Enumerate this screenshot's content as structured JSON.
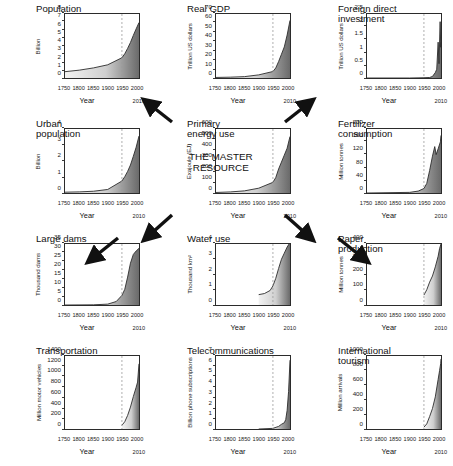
{
  "figure": {
    "xlabel": "Year",
    "x_ticks": [
      "1750",
      "1800",
      "1850",
      "1900",
      "1950",
      "2000"
    ],
    "x_end_label": "2010",
    "marker_year": "1950",
    "center_subtitle": "THE MASTER\nRESOURCE",
    "accent": "#555555",
    "fill_dark": "#6a6a6a",
    "fill_light": "#f2f2f2",
    "line_color": "#2b2b2b"
  },
  "chart_data": [
    {
      "id": "population",
      "type": "area",
      "title": "Population",
      "ylabel": "Billion",
      "xlabel": "Year",
      "ylim": [
        0,
        8
      ],
      "y_ticks": [
        0,
        1,
        2,
        3,
        4,
        5,
        6,
        7,
        8
      ],
      "xlim": [
        1750,
        2010
      ],
      "x": [
        1750,
        1800,
        1850,
        1900,
        1950,
        1960,
        1970,
        1980,
        1990,
        2000,
        2010
      ],
      "values": [
        0.79,
        0.98,
        1.26,
        1.65,
        2.53,
        3.03,
        3.7,
        4.44,
        5.32,
        6.14,
        6.93
      ]
    },
    {
      "id": "real-gdp",
      "type": "area",
      "title": "Real GDP",
      "ylabel": "Trillion US dollars",
      "xlabel": "Year",
      "ylim": [
        0,
        70
      ],
      "y_ticks": [
        0,
        10,
        20,
        30,
        40,
        50,
        60,
        70
      ],
      "xlim": [
        1750,
        2010
      ],
      "x": [
        1750,
        1800,
        1850,
        1900,
        1950,
        1960,
        1970,
        1980,
        1990,
        2000,
        2010
      ],
      "values": [
        0.6,
        0.9,
        1.5,
        3.4,
        7.1,
        11.0,
        18.0,
        26.0,
        34.0,
        47.0,
        63.0
      ]
    },
    {
      "id": "foreign-direct-investment",
      "type": "area",
      "title": "Foreign direct\ninvestment",
      "ylabel": "Trillion US dollars",
      "xlabel": "Year",
      "ylim": [
        0,
        2.5
      ],
      "y_ticks": [
        0,
        0.5,
        1,
        1.5,
        2,
        2.5
      ],
      "xlim": [
        1750,
        2010
      ],
      "x": [
        1750,
        1900,
        1950,
        1970,
        1980,
        1990,
        1995,
        2000,
        2003,
        2007,
        2009,
        2010
      ],
      "values": [
        0,
        0.0,
        0.01,
        0.02,
        0.06,
        0.21,
        0.34,
        1.4,
        0.56,
        2.2,
        1.2,
        1.4
      ]
    },
    {
      "id": "urban-population",
      "type": "area",
      "title": "Urban\npopulation",
      "ylabel": "Billion",
      "xlabel": "Year",
      "ylim": [
        0,
        4
      ],
      "y_ticks": [
        0,
        1,
        2,
        3,
        4
      ],
      "xlim": [
        1750,
        2010
      ],
      "x": [
        1750,
        1800,
        1850,
        1900,
        1950,
        1960,
        1970,
        1980,
        1990,
        2000,
        2010
      ],
      "values": [
        0.05,
        0.07,
        0.11,
        0.22,
        0.75,
        1.02,
        1.35,
        1.75,
        2.29,
        2.86,
        3.56
      ]
    },
    {
      "id": "primary-energy-use",
      "type": "area",
      "title": "Primary\nenergy use",
      "subtitle": "THE MASTER\nRESOURCE",
      "ylabel": "Exajoule (EJ)",
      "xlabel": "Year",
      "ylim": [
        0,
        600
      ],
      "y_ticks": [
        0,
        100,
        200,
        300,
        400,
        500,
        600
      ],
      "xlim": [
        1750,
        2010
      ],
      "x": [
        1750,
        1800,
        1850,
        1900,
        1950,
        1960,
        1970,
        1980,
        1990,
        2000,
        2010
      ],
      "values": [
        5,
        10,
        20,
        45,
        100,
        145,
        225,
        290,
        355,
        420,
        530
      ]
    },
    {
      "id": "fertilizer-consumption",
      "type": "area",
      "title": "Fertilizer\nconsumption",
      "ylabel": "Million tonnes",
      "xlabel": "Year",
      "ylim": [
        0,
        200
      ],
      "y_ticks": [
        0,
        40,
        80,
        120,
        160,
        200
      ],
      "xlim": [
        1750,
        2010
      ],
      "x": [
        1750,
        1900,
        1930,
        1950,
        1960,
        1970,
        1980,
        1988,
        1993,
        2000,
        2008,
        2010
      ],
      "values": [
        0,
        2,
        6,
        14,
        30,
        70,
        115,
        145,
        120,
        138,
        160,
        180
      ]
    },
    {
      "id": "large-dams",
      "type": "area",
      "title": "Large dams",
      "ylabel": "Thousand dams",
      "xlabel": "Year",
      "ylim": [
        0,
        35
      ],
      "y_ticks": [
        0,
        5,
        10,
        15,
        20,
        25,
        30,
        35
      ],
      "xlim": [
        1750,
        2010
      ],
      "x": [
        1750,
        1850,
        1900,
        1930,
        1950,
        1960,
        1970,
        1980,
        1990,
        2000,
        2010
      ],
      "values": [
        0,
        0.1,
        0.5,
        2.0,
        5.5,
        9.0,
        16.0,
        24.0,
        29.0,
        31.0,
        32.5
      ]
    },
    {
      "id": "water-use",
      "type": "area",
      "title": "Water use",
      "ylabel": "Thousand km²",
      "xlabel": "Year",
      "ylim": [
        0,
        4
      ],
      "y_ticks": [
        0,
        1,
        2,
        3,
        4
      ],
      "xlim": [
        1750,
        2010
      ],
      "x": [
        1900,
        1920,
        1940,
        1950,
        1960,
        1970,
        1980,
        1990,
        2000,
        2010
      ],
      "values": [
        0.68,
        0.75,
        0.95,
        1.25,
        1.75,
        2.4,
        3.0,
        3.4,
        3.8,
        4.1
      ]
    },
    {
      "id": "paper-production",
      "type": "area",
      "title": "Paper\nproduction",
      "ylabel": "Million tonnes",
      "xlabel": "Year",
      "ylim": [
        0,
        400
      ],
      "y_ticks": [
        0,
        100,
        200,
        300,
        400
      ],
      "xlim": [
        1750,
        2010
      ],
      "x": [
        1950,
        1960,
        1970,
        1980,
        1990,
        2000,
        2005,
        2010
      ],
      "values": [
        65,
        100,
        150,
        190,
        250,
        320,
        370,
        400
      ]
    },
    {
      "id": "transportation",
      "type": "area",
      "title": "Transportation",
      "ylabel": "Million motor vehicles",
      "xlabel": "Year",
      "ylim": [
        0,
        1400
      ],
      "y_ticks": [
        0,
        200,
        400,
        600,
        800,
        1000,
        1200,
        1400
      ],
      "xlim": [
        1750,
        2010
      ],
      "x": [
        1950,
        1960,
        1970,
        1980,
        1990,
        2000,
        2005,
        2010
      ],
      "values": [
        70,
        140,
        260,
        420,
        620,
        800,
        900,
        1250
      ]
    },
    {
      "id": "telecommunications",
      "type": "area",
      "title": "Telecommunications",
      "ylabel": "Billion phone subscriptions",
      "xlabel": "Year",
      "ylim": [
        0,
        7
      ],
      "y_ticks": [
        0,
        1,
        2,
        3,
        4,
        5,
        6,
        7
      ],
      "xlim": [
        1750,
        2010
      ],
      "x": [
        1900,
        1950,
        1970,
        1980,
        1990,
        1995,
        2000,
        2005,
        2010
      ],
      "values": [
        0,
        0.06,
        0.25,
        0.45,
        0.6,
        0.9,
        1.8,
        3.6,
        6.6
      ]
    },
    {
      "id": "international-tourism",
      "type": "area",
      "title": "International\ntourism",
      "ylabel": "Million arrivals",
      "xlabel": "Year",
      "ylim": [
        0,
        1000
      ],
      "y_ticks": [
        0,
        200,
        400,
        600,
        800,
        1000
      ],
      "xlim": [
        1750,
        2010
      ],
      "x": [
        1950,
        1960,
        1970,
        1980,
        1990,
        2000,
        2005,
        2009,
        2010
      ],
      "values": [
        25,
        70,
        170,
        280,
        440,
        680,
        800,
        900,
        960
      ]
    }
  ]
}
